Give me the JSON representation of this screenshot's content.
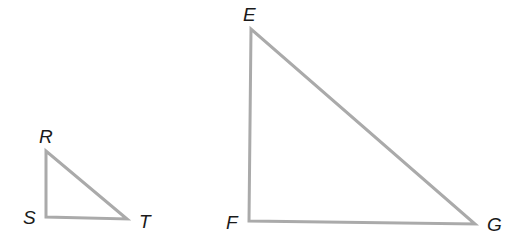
{
  "diagram": {
    "stroke_color": "#aaaaaa",
    "stroke_width": 3,
    "triangles": [
      {
        "name": "RST",
        "vertices": {
          "R": {
            "label": "R",
            "x": 46,
            "y": 151
          },
          "S": {
            "label": "S",
            "x": 46,
            "y": 217
          },
          "T": {
            "label": "T",
            "x": 127,
            "y": 219
          }
        },
        "right_angle_at": "S"
      },
      {
        "name": "EFG",
        "vertices": {
          "E": {
            "label": "E",
            "x": 251,
            "y": 29
          },
          "F": {
            "label": "F",
            "x": 249,
            "y": 221
          },
          "G": {
            "label": "G",
            "x": 475,
            "y": 224
          }
        },
        "right_angle_at": "F"
      }
    ]
  }
}
